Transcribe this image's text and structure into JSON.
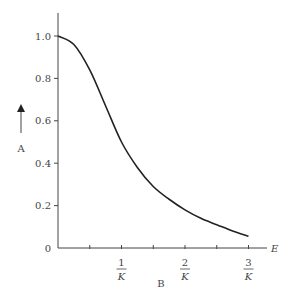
{
  "chart_data": {
    "type": "line",
    "title": "",
    "xlabel": "B",
    "ylabel": "A",
    "x_axis_end_label": "E",
    "x_tick_labels": [
      {
        "num": "1",
        "den": "K"
      },
      {
        "num": "2",
        "den": "K"
      },
      {
        "num": "3",
        "den": "K"
      }
    ],
    "y_tick_labels": [
      "0",
      "0.2",
      "0.4",
      "0.6",
      "0.8",
      "1.0"
    ],
    "ylim": [
      0,
      1.1
    ],
    "xlim": [
      0,
      3.25
    ],
    "grid": false,
    "series": [
      {
        "name": "curve",
        "x": [
          0,
          0.25,
          0.5,
          0.75,
          1.0,
          1.25,
          1.5,
          1.75,
          2.0,
          2.25,
          2.5,
          2.75,
          3.0
        ],
        "values": [
          1.0,
          0.96,
          0.84,
          0.67,
          0.5,
          0.38,
          0.29,
          0.23,
          0.18,
          0.14,
          0.11,
          0.08,
          0.055
        ]
      }
    ]
  }
}
